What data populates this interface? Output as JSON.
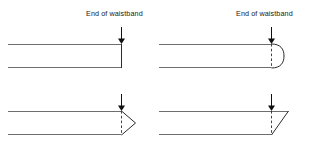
{
  "figure": {
    "width": 310,
    "height": 149,
    "background_color": "#ffffff",
    "band_line_color": "#6e6e6e",
    "edge_line_color": "#2b2b2b",
    "arrow_color": "#111111"
  },
  "labels": {
    "end_of_waistband": "End of waistband"
  },
  "panels": [
    {
      "id": "square-end",
      "position": "top-left",
      "label": "End of waistband",
      "has_label": true,
      "end_style": "square",
      "has_dashed_marker": false,
      "arrow": {
        "x": 121,
        "y_top": 27,
        "y_tip": 43
      },
      "band": {
        "x_left": 8,
        "x_end": 121,
        "y_top": 44,
        "y_bottom": 68
      }
    },
    {
      "id": "rounded-end",
      "position": "top-right",
      "label": "End of waistband",
      "has_label": true,
      "end_style": "rounded",
      "has_dashed_marker": true,
      "arrow": {
        "x": 271,
        "y_top": 27,
        "y_tip": 43
      },
      "band": {
        "x_left": 159,
        "x_end": 271,
        "y_top": 44,
        "y_bottom": 68
      },
      "extension": 12
    },
    {
      "id": "pointed-end",
      "position": "bottom-left",
      "label": "",
      "has_label": false,
      "end_style": "pointed",
      "has_dashed_marker": true,
      "arrow": {
        "x": 121,
        "y_top": 94,
        "y_tip": 110
      },
      "band": {
        "x_left": 8,
        "x_end": 121,
        "y_top": 111,
        "y_bottom": 135
      },
      "extension": 14
    },
    {
      "id": "angled-end",
      "position": "bottom-right",
      "label": "",
      "has_label": false,
      "end_style": "angled",
      "has_dashed_marker": true,
      "arrow": {
        "x": 271,
        "y_top": 94,
        "y_tip": 110
      },
      "band": {
        "x_left": 159,
        "x_end": 271,
        "y_top": 111,
        "y_bottom": 135
      },
      "extension": 17
    }
  ]
}
